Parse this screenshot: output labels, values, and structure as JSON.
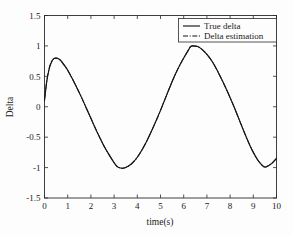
{
  "chart_data": {
    "type": "line",
    "title": "",
    "xlabel": "time(s)",
    "ylabel": "Delta",
    "xlim": [
      0,
      10
    ],
    "ylim": [
      -1.5,
      1.5
    ],
    "xticks": [
      "0",
      "1",
      "2",
      "3",
      "4",
      "5",
      "6",
      "7",
      "8",
      "9",
      "10"
    ],
    "yticks": [
      "1.5",
      "1",
      "0.5",
      "0",
      "-0.5",
      "-1",
      "-1.5"
    ],
    "xtick_values": [
      0,
      1,
      2,
      3,
      4,
      5,
      6,
      7,
      8,
      9,
      10
    ],
    "ytick_values": [
      1.5,
      1,
      0.5,
      0,
      -0.5,
      -1,
      -1.5
    ],
    "grid": false,
    "legend_position": "top-right",
    "series": [
      {
        "name": "True delta",
        "style": "solid",
        "color": "#151515",
        "x": [
          0,
          0.1,
          0.2,
          0.3,
          0.4,
          0.5,
          0.6,
          0.7,
          0.8,
          0.9,
          1.0,
          1.2,
          1.4,
          1.6,
          1.8,
          2.0,
          2.2,
          2.4,
          2.6,
          2.8,
          3.0,
          3.1,
          3.2,
          3.4,
          3.6,
          3.8,
          4.0,
          4.2,
          4.4,
          4.6,
          4.8,
          5.0,
          5.2,
          5.4,
          5.6,
          5.8,
          6.0,
          6.2,
          6.3,
          6.4,
          6.6,
          6.8,
          7.0,
          7.2,
          7.4,
          7.6,
          7.8,
          8.0,
          8.2,
          8.4,
          8.6,
          8.8,
          9.0,
          9.2,
          9.4,
          9.5,
          9.6,
          9.8,
          10.0
        ],
        "y": [
          0.1,
          0.42,
          0.62,
          0.73,
          0.79,
          0.8,
          0.79,
          0.76,
          0.71,
          0.66,
          0.6,
          0.46,
          0.31,
          0.15,
          -0.02,
          -0.19,
          -0.36,
          -0.52,
          -0.67,
          -0.8,
          -0.92,
          -0.97,
          -1.0,
          -1.01,
          -0.98,
          -0.92,
          -0.83,
          -0.71,
          -0.57,
          -0.41,
          -0.24,
          -0.06,
          0.13,
          0.32,
          0.5,
          0.66,
          0.8,
          0.93,
          0.99,
          1.0,
          0.99,
          0.94,
          0.86,
          0.76,
          0.63,
          0.48,
          0.32,
          0.15,
          -0.03,
          -0.22,
          -0.41,
          -0.59,
          -0.75,
          -0.88,
          -0.97,
          -0.99,
          -0.98,
          -0.93,
          -0.85
        ]
      },
      {
        "name": "Delta estimation",
        "style": "dash-dot",
        "color": "#151515",
        "x": [
          0,
          0.1,
          0.2,
          0.3,
          0.4,
          0.5,
          0.6,
          0.7,
          0.8,
          0.9,
          1.0,
          1.2,
          1.4,
          1.6,
          1.8,
          2.0,
          2.2,
          2.4,
          2.6,
          2.8,
          3.0,
          3.1,
          3.2,
          3.4,
          3.6,
          3.8,
          4.0,
          4.2,
          4.4,
          4.6,
          4.8,
          5.0,
          5.2,
          5.4,
          5.6,
          5.8,
          6.0,
          6.2,
          6.3,
          6.4,
          6.6,
          6.8,
          7.0,
          7.2,
          7.4,
          7.6,
          7.8,
          8.0,
          8.2,
          8.4,
          8.6,
          8.8,
          9.0,
          9.2,
          9.4,
          9.5,
          9.6,
          9.8,
          10.0
        ],
        "y": [
          0.12,
          0.43,
          0.63,
          0.74,
          0.79,
          0.8,
          0.79,
          0.76,
          0.71,
          0.66,
          0.6,
          0.46,
          0.31,
          0.15,
          -0.02,
          -0.19,
          -0.36,
          -0.52,
          -0.67,
          -0.8,
          -0.92,
          -0.97,
          -1.0,
          -1.01,
          -0.98,
          -0.92,
          -0.83,
          -0.71,
          -0.57,
          -0.41,
          -0.24,
          -0.06,
          0.13,
          0.32,
          0.5,
          0.66,
          0.8,
          0.93,
          0.99,
          1.0,
          0.99,
          0.94,
          0.86,
          0.76,
          0.63,
          0.48,
          0.32,
          0.15,
          -0.03,
          -0.22,
          -0.41,
          -0.59,
          -0.75,
          -0.88,
          -0.97,
          -0.99,
          -0.98,
          -0.93,
          -0.85
        ]
      }
    ]
  },
  "legend": {
    "entries": [
      {
        "label": "True delta"
      },
      {
        "label": "Delta estimation"
      }
    ]
  },
  "axes": {
    "x_title": "time(s)",
    "y_title": "Delta"
  }
}
